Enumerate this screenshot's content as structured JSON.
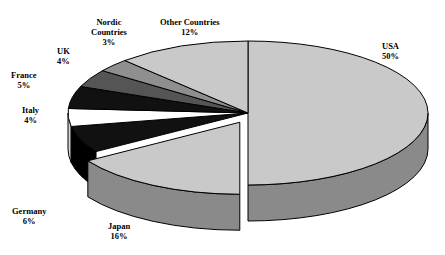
{
  "chart_data": {
    "type": "pie",
    "title": "",
    "subtitle": "",
    "xlabel": "",
    "ylabel": "",
    "units": "percent",
    "three_d": true,
    "legend_position": "none",
    "labels_outside": true,
    "exploded_slices": [
      "Japan"
    ],
    "categories": [
      "USA",
      "Japan",
      "Germany",
      "Italy",
      "France",
      "UK",
      "Nordic Countries",
      "Other Countries"
    ],
    "values": [
      50,
      16,
      6,
      4,
      5,
      4,
      3,
      12
    ],
    "slices": [
      {
        "name": "USA",
        "value": 50,
        "pct_text": "50%",
        "top_color": "#c9c9c9",
        "side_color": "#8a8a8a",
        "exploded": false
      },
      {
        "name": "Japan",
        "value": 16,
        "pct_text": "16%",
        "top_color": "#c9c9c9",
        "side_color": "#8a8a8a",
        "exploded": true
      },
      {
        "name": "Germany",
        "value": 6,
        "pct_text": "6%",
        "top_color": "#111111",
        "side_color": "#000000",
        "exploded": false
      },
      {
        "name": "Italy",
        "value": 4,
        "pct_text": "4%",
        "top_color": "#ffffff",
        "side_color": "#d8d8d8",
        "exploded": false
      },
      {
        "name": "France",
        "value": 5,
        "pct_text": "5%",
        "top_color": "#111111",
        "side_color": "#000000",
        "exploded": false
      },
      {
        "name": "UK",
        "value": 4,
        "pct_text": "4%",
        "top_color": "#555555",
        "side_color": "#2e2e2e",
        "exploded": false
      },
      {
        "name": "Nordic Countries",
        "value": 3,
        "pct_text": "3%",
        "top_color": "#8f8f8f",
        "side_color": "#5e5e5e",
        "exploded": false
      },
      {
        "name": "Other Countries",
        "value": 12,
        "pct_text": "12%",
        "top_color": "#c9c9c9",
        "side_color": "#8a8a8a",
        "exploded": false
      }
    ]
  },
  "labels": {
    "usa": {
      "name": "USA",
      "pct": "50%"
    },
    "japan": {
      "name": "Japan",
      "pct": "16%"
    },
    "germany": {
      "name": "Germany",
      "pct": "6%"
    },
    "italy": {
      "name": "Italy",
      "pct": "4%"
    },
    "france": {
      "name": "France",
      "pct": "5%"
    },
    "uk": {
      "name": "UK",
      "pct": "4%"
    },
    "nordic": {
      "name1": "Nordic",
      "name2": "Countries",
      "pct": "3%"
    },
    "other": {
      "name": "Other Countries",
      "pct": "12%"
    }
  },
  "colors": {
    "outline": "#000000",
    "background": "#ffffff",
    "light_gray": "#c9c9c9",
    "mid_gray": "#8a8a8a",
    "dark_gray": "#555555",
    "nordic_gray": "#8f8f8f",
    "black": "#111111",
    "white": "#ffffff"
  }
}
